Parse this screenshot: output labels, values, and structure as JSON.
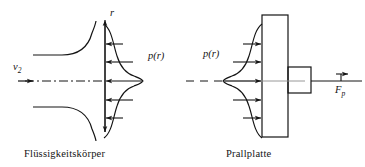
{
  "figure": {
    "type": "engineering-diagram",
    "captions": {
      "left": "Flüssigkeitskörper",
      "right": "Prallplatte"
    },
    "left_panel": {
      "axis_label_vertical": "r",
      "inlet_velocity_label": "v₂",
      "inlet_velocity_base": "v",
      "inlet_velocity_sub": "2",
      "pressure_label": "p(r)",
      "arrow_direction": "left",
      "arrow_count": 5,
      "centerline_style": "dash-dot"
    },
    "right_panel": {
      "pressure_label": "p(r)",
      "force_label": "Fₚ",
      "force_base": "F",
      "force_sub": "p",
      "force_arrow": "vector-arrow-over-symbol",
      "arrow_direction": "right",
      "arrow_count": 5,
      "plate_name": "Prallplatte",
      "centerline_style": "dashed"
    },
    "colors": {
      "stroke": "#141414",
      "background": "#ffffff",
      "text": "#141414"
    }
  }
}
